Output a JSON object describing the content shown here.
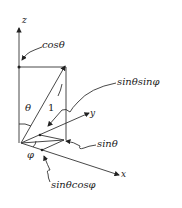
{
  "diagram": {
    "title": "",
    "axes": {
      "z_label": "z",
      "y_label": "y",
      "x_label": "x"
    },
    "annotations": {
      "cos_theta": "cosθ",
      "sin_theta_sin_phi": "sinθsinφ",
      "sin_theta": "sinθ",
      "sin_theta_cos_phi": "sinθcosφ",
      "theta": "θ",
      "unit_length": "1",
      "phi": "φ"
    },
    "colors": {
      "ink": "#222222",
      "background": "#ffffff"
    }
  }
}
